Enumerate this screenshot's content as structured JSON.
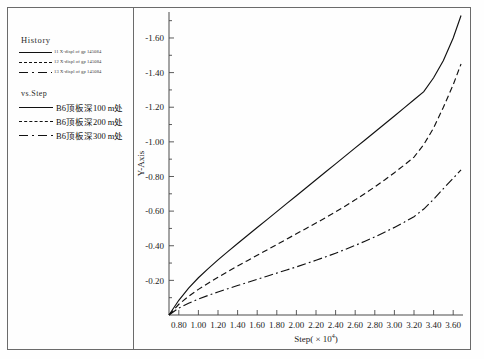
{
  "legend": {
    "history_title": "History",
    "history_items": [
      {
        "id": "11",
        "label": "11  X-displ  of  gp  145084",
        "style": "solid"
      },
      {
        "id": "12",
        "label": "12  X-displ  of  gp  145084",
        "style": "dash"
      },
      {
        "id": "13",
        "label": "13  X-displ  of  gp  145084",
        "style": "dashdot"
      }
    ],
    "vs_title": "vs.Step",
    "series_items": [
      {
        "label": "B6顶板深100 m处",
        "style": "solid"
      },
      {
        "label": "B6顶板深200 m处",
        "style": "dash"
      },
      {
        "label": "B6顶板深300 m处",
        "style": "dashdot"
      }
    ]
  },
  "chart_data": {
    "type": "line",
    "title": "",
    "xlabel": "Step( × 10",
    "xlabel_exponent": "4",
    "xlabel_suffix": ")",
    "ylabel": "Y-Axis",
    "xlim": [
      0.7,
      3.7
    ],
    "ylim": [
      0.0,
      -1.75
    ],
    "xticks": [
      "0.80",
      "1.00",
      "1.20",
      "1.40",
      "1.60",
      "1.80",
      "2.00",
      "2.20",
      "2.40",
      "2.60",
      "2.80",
      "3.00",
      "3.20",
      "3.40",
      "3.60"
    ],
    "xtick_values": [
      0.8,
      1.0,
      1.2,
      1.4,
      1.6,
      1.8,
      2.0,
      2.2,
      2.4,
      2.6,
      2.8,
      3.0,
      3.2,
      3.4,
      3.6
    ],
    "yticks": [
      "-0.20",
      "-0.40",
      "-0.60",
      "-0.80",
      "-1.00",
      "-1.20",
      "-1.40",
      "-1.60"
    ],
    "ytick_values": [
      -0.2,
      -0.4,
      -0.6,
      -0.8,
      -1.0,
      -1.2,
      -1.4,
      -1.6
    ],
    "grid": false,
    "legend_position": "left-panel",
    "x": [
      0.7,
      0.8,
      0.9,
      1.0,
      1.1,
      1.2,
      1.3,
      1.4,
      1.5,
      1.6,
      1.7,
      1.8,
      1.9,
      2.0,
      2.1,
      2.2,
      2.3,
      2.4,
      2.5,
      2.6,
      2.7,
      2.8,
      2.9,
      3.0,
      3.1,
      3.2,
      3.3,
      3.4,
      3.5,
      3.6,
      3.68
    ],
    "series": [
      {
        "name": "B6顶板深100 m处",
        "style": "solid",
        "values": [
          0.0,
          -0.085,
          -0.155,
          -0.215,
          -0.268,
          -0.318,
          -0.366,
          -0.413,
          -0.459,
          -0.505,
          -0.551,
          -0.597,
          -0.643,
          -0.689,
          -0.735,
          -0.781,
          -0.827,
          -0.873,
          -0.919,
          -0.965,
          -1.011,
          -1.057,
          -1.103,
          -1.149,
          -1.196,
          -1.243,
          -1.29,
          -1.37,
          -1.47,
          -1.6,
          -1.73
        ]
      },
      {
        "name": "B6顶板深200 m处",
        "style": "dash",
        "values": [
          0.0,
          -0.062,
          -0.108,
          -0.148,
          -0.184,
          -0.218,
          -0.251,
          -0.283,
          -0.314,
          -0.345,
          -0.376,
          -0.407,
          -0.438,
          -0.469,
          -0.5,
          -0.531,
          -0.563,
          -0.596,
          -0.63,
          -0.665,
          -0.702,
          -0.74,
          -0.78,
          -0.822,
          -0.866,
          -0.912,
          -0.985,
          -1.08,
          -1.2,
          -1.33,
          -1.45
        ]
      },
      {
        "name": "B6顶板深300 m处",
        "style": "dashdot",
        "values": [
          0.0,
          -0.04,
          -0.068,
          -0.092,
          -0.113,
          -0.133,
          -0.152,
          -0.17,
          -0.188,
          -0.206,
          -0.224,
          -0.242,
          -0.26,
          -0.278,
          -0.297,
          -0.316,
          -0.336,
          -0.357,
          -0.379,
          -0.402,
          -0.426,
          -0.451,
          -0.478,
          -0.506,
          -0.536,
          -0.568,
          -0.612,
          -0.668,
          -0.73,
          -0.79,
          -0.838
        ]
      }
    ]
  }
}
